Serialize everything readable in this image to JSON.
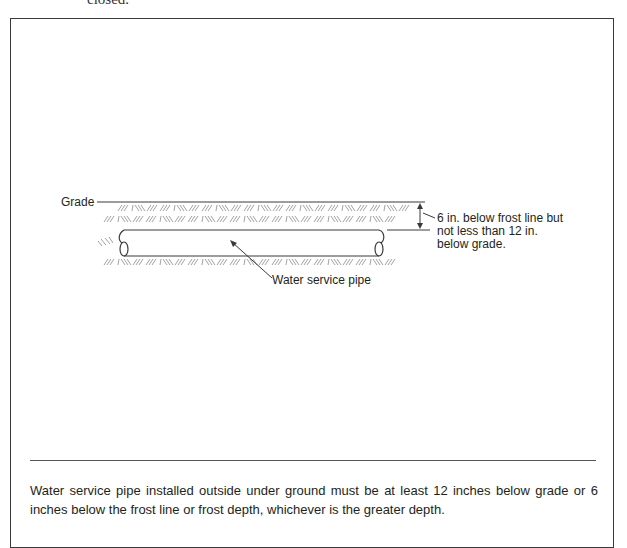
{
  "page": {
    "top_fragment": "closed."
  },
  "figure": {
    "labels": {
      "grade": "Grade",
      "pipe": "Water service pipe",
      "depth_line1": "6 in. below frost line but",
      "depth_line2": "not less than 12 in.",
      "depth_line3": "below grade."
    },
    "caption": "Water service pipe installed outside under ground must be at least 12 inches below grade or 6 inches below the frost line or frost depth, whichever is the greater depth."
  }
}
